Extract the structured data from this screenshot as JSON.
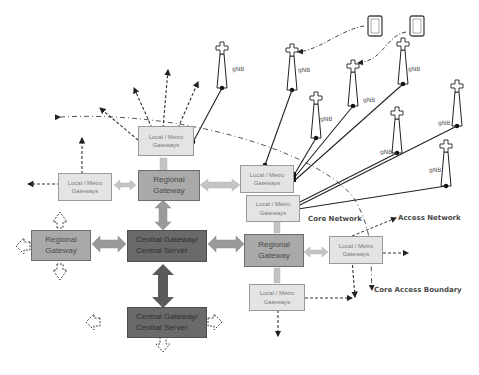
{
  "diagram": {
    "type": "network-architecture",
    "nodes": {
      "local_metro_label": "Local / Metro",
      "local_metro_label2": "Gateways",
      "regional_label": "Regional",
      "regional_label2": "Gateway",
      "central_label": "Central Gateway/",
      "central_label2": "Central Server",
      "gnb_label": "gNB"
    },
    "annotations": {
      "core_network": "Core Network",
      "access_network": "Access Network",
      "core_access_boundary": "Core Access Boundary"
    },
    "colors": {
      "local_metro_fill": "#e4e4e4",
      "regional_fill": "#a9a9a9",
      "central_fill": "#6a6a6a",
      "arrow_light": "#c4c4c4",
      "arrow_dark": "#5a5a5a"
    }
  }
}
